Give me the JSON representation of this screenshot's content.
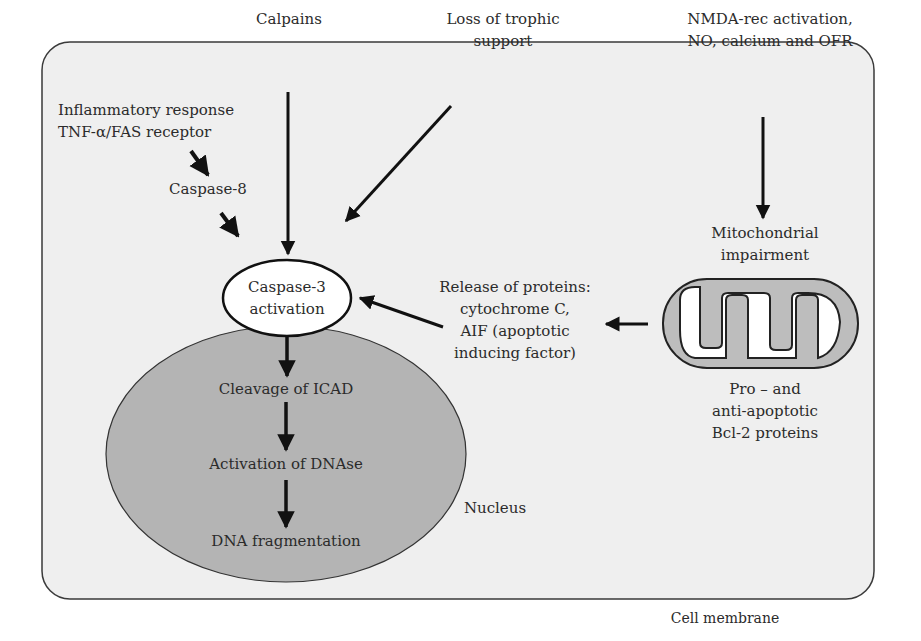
{
  "colors": {
    "cell_fill": "#efefef",
    "cell_border": "#3a3a3a",
    "nucleus_fill": "#b4b4b4",
    "caspase_fill": "#ffffff",
    "arrow": "#111111",
    "mito_inner_fill": "#ffffff",
    "mito_membrane": "#bdbdbd"
  },
  "labels": {
    "calpains": "Calpains",
    "loss_trophic": [
      "Loss of trophic",
      "support"
    ],
    "inflammatory": [
      "Inflammatory response",
      "TNF-α/FAS receptor"
    ],
    "caspase8": "Caspase-8",
    "nmda": [
      "NMDA-rec activation,",
      "NO, calcium and OFR"
    ],
    "mito_impairment": [
      "Mitochondrial",
      "impairment"
    ],
    "caspase3": [
      "Caspase-3",
      "activation"
    ],
    "release": [
      "Release of proteins:",
      "cytochrome C,",
      "AIF (apoptotic",
      "inducing factor)"
    ],
    "bcl2": [
      "Pro – and",
      "anti-apoptotic",
      "Bcl-2 proteins"
    ],
    "icad": "Cleavage of ICAD",
    "dnase": "Activation of DNAse",
    "fragmentation": "DNA fragmentation",
    "nucleus": "Nucleus",
    "cell_membrane": "Cell membrane"
  }
}
